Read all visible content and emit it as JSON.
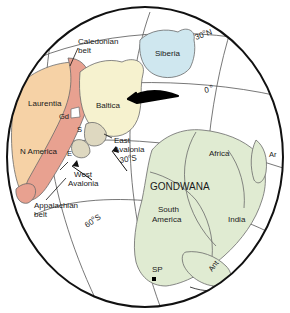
{
  "figure": {
    "kind": "paleogeographic-globe-map",
    "projection": "orthographic-hemisphere",
    "background_color": "#ffffff",
    "globe_outline_color": "#111111",
    "graticule_color": "#555555"
  },
  "palette": {
    "laurentia_fill": "#f6d2a6",
    "caledonian_belt_fill": "#e8a190",
    "baltica_fill": "#f6f2cf",
    "siberia_fill": "#cfe7ef",
    "gondwana_fill": "#e0ebd2",
    "avalonia_fill": "#ded8c0",
    "outline": "#4a4a4a",
    "label_color": "#1a1a1a",
    "marker_color": "#000000"
  },
  "continents": [
    {
      "id": "laurentia",
      "label": "Laurentia",
      "fill": "#f6d2a6"
    },
    {
      "id": "n-america",
      "label": "N America",
      "fill": "#f6d2a6"
    },
    {
      "id": "baltica",
      "label": "Baltica",
      "fill": "#f6f2cf"
    },
    {
      "id": "siberia",
      "label": "Siberia",
      "fill": "#cfe7ef"
    },
    {
      "id": "gondwana",
      "label": "GONDWANA",
      "fill": "#e0ebd2"
    },
    {
      "id": "africa",
      "label": "Africa",
      "fill": "#e0ebd2"
    },
    {
      "id": "south-america",
      "label": "South\nAmerica",
      "fill": "#e0ebd2"
    },
    {
      "id": "india",
      "label": "India",
      "fill": "#e0ebd2"
    },
    {
      "id": "arabia",
      "label": "Ar",
      "fill": "#e0ebd2"
    },
    {
      "id": "antarctica",
      "label": "Ant",
      "fill": "#e0ebd2"
    }
  ],
  "labels": {
    "laurentia": "Laurentia",
    "n_america": "N America",
    "baltica": "Baltica",
    "siberia": "Siberia",
    "gondwana": "GONDWANA",
    "africa": "Africa",
    "south_america_line1": "South",
    "south_america_line2": "America",
    "india": "India",
    "arabia": "Ar",
    "antarctica": "Ant",
    "caledonian_line1": "Caledonian",
    "caledonian_line2": "belt",
    "appalachian_line1": "Appalachian",
    "appalachian_line2": "belt",
    "east_avalonia_line1": "East",
    "east_avalonia_line2": "Avalonia",
    "west_avalonia_line1": "West",
    "west_avalonia_line2": "Avalonia",
    "greenland_abbr": "Gd",
    "scotland_abbr": "S",
    "england_abbr": "E",
    "south_pole_abbr": "SP"
  },
  "graticule": {
    "lat_30n": "30",
    "lat_30n_sup": "o",
    "lat_30n_hemi": "N",
    "lat_0": "0",
    "lat_0_sup": "o",
    "lat_30s": "30",
    "lat_30s_sup": "o",
    "lat_30s_hemi": "S",
    "lat_60s": "60",
    "lat_60s_sup": "o",
    "lat_60s_hemi": "S"
  },
  "markers": {
    "south_pole_symbol": "square-marker"
  },
  "arrows": [
    {
      "id": "baltica-motion-arrow",
      "style": "thick-curved-taper",
      "direction": "westward"
    },
    {
      "id": "east-avalonia-leader-arrow",
      "style": "thin-line-arrow"
    },
    {
      "id": "west-avalonia-leader-arrow",
      "style": "thin-line-arrow"
    },
    {
      "id": "antarctica-motion-arrow",
      "style": "thin-open-arrow"
    }
  ]
}
